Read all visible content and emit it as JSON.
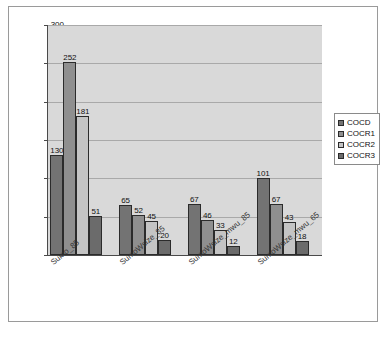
{
  "chart_data": {
    "type": "bar",
    "title": "",
    "xlabel": "",
    "ylabel": "",
    "ylim": [
      0,
      300
    ],
    "yticks": [
      0,
      50,
      100,
      150,
      200,
      250,
      300
    ],
    "grid": true,
    "legend_position": "right",
    "categories": [
      "Sumo_85",
      "SumoWsize_85",
      "SumoWsize_mwu_85",
      "SumoWsize_mwu_65"
    ],
    "series": [
      {
        "name": "COCD",
        "color": "#737373",
        "values": [
          130,
          65,
          67,
          101
        ]
      },
      {
        "name": "COCR1",
        "color": "#8f8f8f",
        "values": [
          252,
          52,
          46,
          67
        ]
      },
      {
        "name": "COCR2",
        "color": "#c4c4c4",
        "values": [
          181,
          45,
          33,
          43
        ]
      },
      {
        "name": "COCR3",
        "color": "#6b6b6b",
        "values": [
          51,
          20,
          12,
          18
        ]
      }
    ]
  },
  "legend": {
    "items": [
      {
        "label": "COCD"
      },
      {
        "label": "COCR1"
      },
      {
        "label": "COCR2"
      },
      {
        "label": "COCR3"
      }
    ]
  }
}
